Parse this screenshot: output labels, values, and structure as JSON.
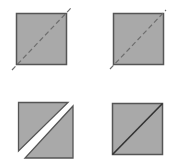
{
  "diagram": {
    "colors": {
      "fill": "#a9a9a9",
      "stroke": "#5a5a5a",
      "cut_line": "#6e6e6e",
      "background": "#ffffff"
    },
    "panels": [
      {
        "id": "step-1",
        "label": "square with dashed diagonal guide (extends beyond corners)"
      },
      {
        "id": "step-2",
        "label": "square with dashed diagonal guide (ending at corner)"
      },
      {
        "id": "step-3",
        "label": "square cut into two separated triangles"
      },
      {
        "id": "step-4",
        "label": "square with solid diagonal seam"
      }
    ]
  }
}
